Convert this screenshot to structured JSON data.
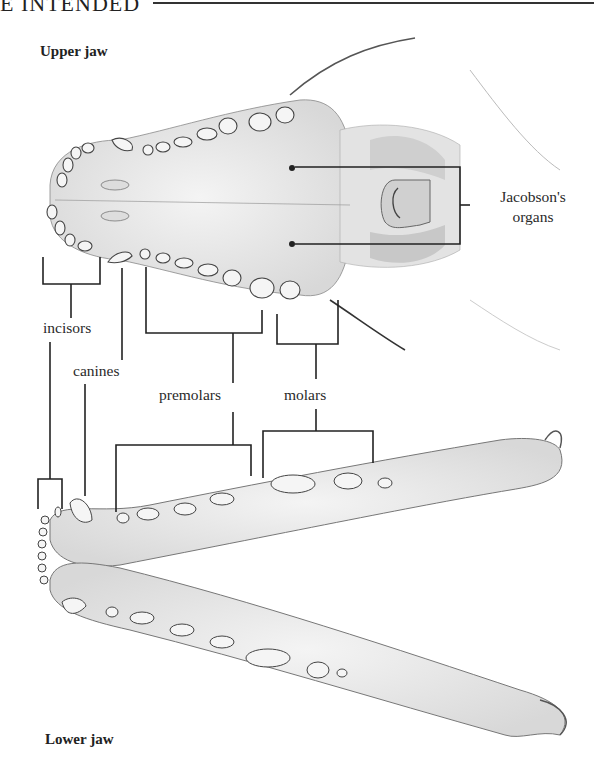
{
  "page": {
    "running_header": "E INTENDED"
  },
  "figure": {
    "upper_caption": "Upper jaw",
    "lower_caption": "Lower jaw",
    "labels": {
      "jacobson_line1": "Jacobson's",
      "jacobson_line2": "organs",
      "incisors": "incisors",
      "canines": "canines",
      "premolars": "premolars",
      "molars": "molars"
    }
  },
  "colors": {
    "ink": "#222222",
    "bone_shade": "#c9c9c9",
    "paper": "#ffffff"
  }
}
